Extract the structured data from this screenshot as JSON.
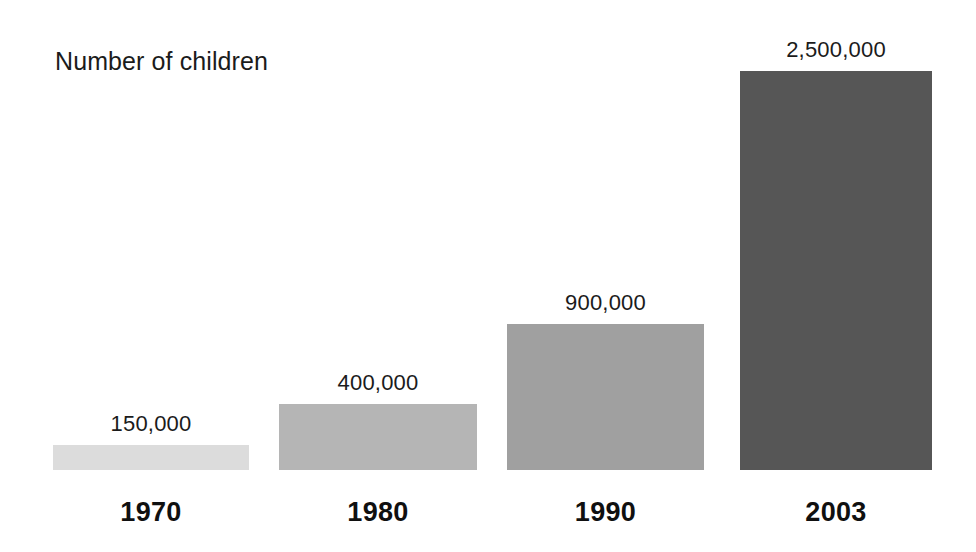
{
  "figure": {
    "background_color": "#ffffff",
    "title": "Number of children",
    "text_color": "#1b1b1b",
    "width": 976,
    "height": 552
  },
  "chart_data": {
    "type": "bar",
    "title": "Number of children",
    "subtitle": "",
    "xlabel": "",
    "ylabel": "Number of children",
    "categories": [
      "1970",
      "1980",
      "1990",
      "2003"
    ],
    "values": [
      150000,
      900000,
      400000,
      2500000
    ],
    "value_labels": [
      "150,000",
      "400,000",
      "900,000",
      "2,500,000"
    ],
    "series": [
      {
        "name": "Number of children",
        "values": [
          150000,
          400000,
          900000,
          2500000
        ]
      }
    ],
    "grid": false,
    "axis_lines": false,
    "legend": false,
    "legend_position": "none",
    "orientation": "vertical",
    "bar_colors": [
      "#dcdcdc",
      "#b5b5b5",
      "#a0a0a0",
      "#565656"
    ]
  },
  "bars": [
    {
      "category": "1970",
      "value_label": "150,000",
      "color": "#dcdcdc",
      "left": 53,
      "width": 196,
      "height": 25,
      "value_top_offset": -34,
      "category_bottom_offset": -58
    },
    {
      "category": "1980",
      "value_label": "400,000",
      "color": "#b5b5b5",
      "left": 279,
      "width": 198,
      "height": 66,
      "value_top_offset": -34,
      "category_bottom_offset": -58
    },
    {
      "category": "1990",
      "value_label": "900,000",
      "color": "#a0a0a0",
      "left": 507,
      "width": 197,
      "height": 146,
      "value_top_offset": -34,
      "category_bottom_offset": -58
    },
    {
      "category": "2003",
      "value_label": "2,500,000",
      "color": "#565656",
      "left": 740,
      "width": 192,
      "height": 399,
      "value_top_offset": -34,
      "category_bottom_offset": -58
    }
  ]
}
